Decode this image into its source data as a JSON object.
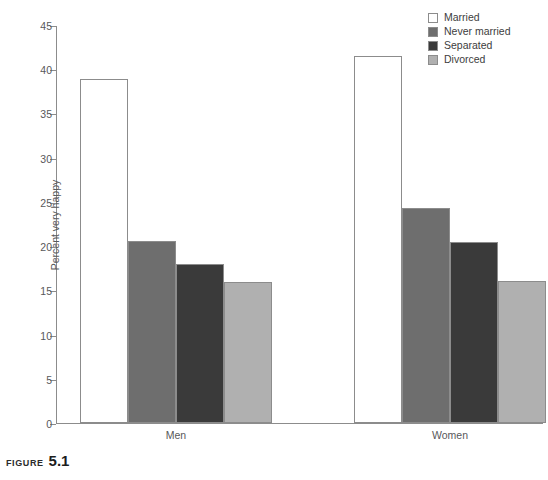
{
  "chart_data": {
    "type": "bar",
    "title": "",
    "xlabel": "",
    "ylabel": "Percent very happy",
    "ylim": [
      0,
      45
    ],
    "yticks": [
      0,
      5,
      10,
      15,
      20,
      25,
      30,
      35,
      40,
      45
    ],
    "ytick_labels": [
      "0",
      "5",
      "10",
      "15",
      "20",
      "25",
      "30",
      "35",
      "40",
      "45"
    ],
    "grid": false,
    "legend_position": "top-right",
    "categories": [
      "Men",
      "Women"
    ],
    "series": [
      {
        "name": "Married",
        "color": "#ffffff",
        "values": [
          38.9,
          41.5
        ]
      },
      {
        "name": "Never married",
        "color": "#6e6e6e",
        "values": [
          20.6,
          24.3
        ]
      },
      {
        "name": "Separated",
        "color": "#3a3a3a",
        "values": [
          18.0,
          20.5
        ]
      },
      {
        "name": "Divorced",
        "color": "#b0b0b0",
        "values": [
          15.9,
          16.1
        ]
      }
    ]
  },
  "legend": {
    "items": [
      {
        "label": "Married",
        "color": "#ffffff"
      },
      {
        "label": "Never married",
        "color": "#6e6e6e"
      },
      {
        "label": "Separated",
        "color": "#3a3a3a"
      },
      {
        "label": "Divorced",
        "color": "#b0b0b0"
      }
    ]
  },
  "caption": {
    "word": "FIGURE",
    "number": "5.1"
  }
}
